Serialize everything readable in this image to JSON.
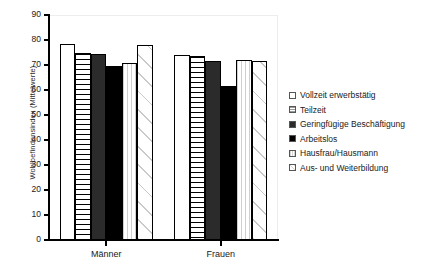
{
  "chart_data": {
    "type": "bar",
    "title": "",
    "xlabel": "",
    "ylabel": "Wohlbefindensindex (Mittelwerte)",
    "ylim": [
      0,
      90
    ],
    "yticks": [
      0,
      10,
      20,
      30,
      40,
      50,
      60,
      70,
      80,
      90
    ],
    "ytick_labels": [
      "0",
      "10",
      "20",
      "30",
      "40",
      "50",
      "60",
      "70",
      "80",
      "90"
    ],
    "grid": false,
    "legend_position": "right",
    "categories": [
      "Männer",
      "Frauen"
    ],
    "series": [
      {
        "name": "Vollzeit erwerbstätig",
        "pattern": "solid-white",
        "values": [
          78.5,
          74.0
        ]
      },
      {
        "name": "Teilzeit",
        "pattern": "hlines",
        "values": [
          75.0,
          73.5
        ]
      },
      {
        "name": "Geringfügige Beschäftigung",
        "pattern": "darkgray",
        "values": [
          74.5,
          71.5
        ]
      },
      {
        "name": "Arbeitslos",
        "pattern": "black",
        "values": [
          69.5,
          61.5
        ]
      },
      {
        "name": "Hausfrau/Hausmann",
        "pattern": "vlines",
        "values": [
          71.0,
          72.0
        ]
      },
      {
        "name": "Aus- und Weiterbildung",
        "pattern": "diag",
        "values": [
          78.0,
          71.5
        ]
      }
    ]
  },
  "legend": {
    "items": [
      {
        "label": "Vollzeit erwerbstätig",
        "swatch": "sw-white"
      },
      {
        "label": "Teilzeit",
        "swatch": "sw-hlines"
      },
      {
        "label": "Geringfügige Beschäftigung",
        "swatch": "sw-darkgray"
      },
      {
        "label": "Arbeitslos",
        "swatch": "sw-black"
      },
      {
        "label": "Hausfrau/Hausmann",
        "swatch": "sw-vlines"
      },
      {
        "label": "Aus- und Weiterbildung",
        "swatch": "sw-diag"
      }
    ]
  },
  "colors": {
    "axis": "#000000",
    "plot_border": "#ededed",
    "background": "#ffffff",
    "bar_dark": "#2b2b2b",
    "bar_black": "#000000",
    "text": "#1a1a1a"
  }
}
